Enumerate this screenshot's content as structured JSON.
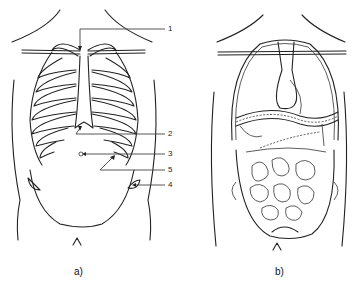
{
  "figure": {
    "panel_a": {
      "caption": "a)",
      "subject": "rib cage and abdomen outline",
      "labels": [
        {
          "id": "1",
          "text": "1",
          "x": 168,
          "y": 25
        },
        {
          "id": "2",
          "text": "2",
          "x": 168,
          "y": 130
        },
        {
          "id": "3",
          "text": "3",
          "x": 168,
          "y": 150
        },
        {
          "id": "5",
          "text": "5",
          "x": 168,
          "y": 166
        },
        {
          "id": "4",
          "text": "4",
          "x": 168,
          "y": 181
        }
      ]
    },
    "panel_b": {
      "caption": "b)",
      "subject": "thoracic and abdominal organs"
    },
    "colors": {
      "line": "#222222",
      "background": "#ffffff"
    }
  }
}
